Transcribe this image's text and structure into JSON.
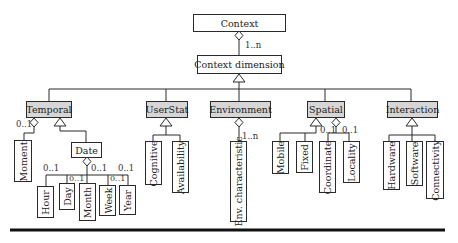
{
  "diagram": {
    "root": {
      "label": "Context"
    },
    "dimension": {
      "label": "Context dimension",
      "multiplicity": "1..n"
    },
    "categories": [
      {
        "label": "Temporal",
        "children": [
          {
            "label": "Moment",
            "multiplicity": "0..1",
            "relation": "aggregation"
          },
          {
            "label": "Date",
            "relation": "generalization",
            "children": [
              {
                "label": "Hour",
                "multiplicity": "0..1"
              },
              {
                "label": "Day",
                "multiplicity": "0..1"
              },
              {
                "label": "Month",
                "multiplicity": "0..1"
              },
              {
                "label": "Week",
                "multiplicity": "0..1"
              },
              {
                "label": "Year",
                "multiplicity": "0..1"
              }
            ]
          }
        ]
      },
      {
        "label": "UserStat",
        "children": [
          {
            "label": "Cognitive",
            "relation": "generalization"
          },
          {
            "label": "Availability",
            "relation": "generalization"
          }
        ]
      },
      {
        "label": "Environment",
        "children": [
          {
            "label": "Env. characteristic",
            "multiplicity": "1..n",
            "relation": "aggregation"
          }
        ]
      },
      {
        "label": "Spatial",
        "children": [
          {
            "label": "Mobile",
            "relation": "generalization"
          },
          {
            "label": "Fixed",
            "relation": "generalization"
          },
          {
            "label": "Coordinate",
            "multiplicity": "0..1",
            "relation": "aggregation"
          },
          {
            "label": "Locality",
            "multiplicity": "0..1",
            "relation": "aggregation"
          }
        ]
      },
      {
        "label": "Interaction",
        "children": [
          {
            "label": "Hardware",
            "relation": "generalization"
          },
          {
            "label": "Software",
            "relation": "generalization"
          },
          {
            "label": "Connectivity",
            "relation": "generalization"
          }
        ]
      }
    ],
    "labels": {
      "ctx_mult": "1..n",
      "moment_mult": "0..1",
      "hour_mult": "0..1",
      "day_mult": "0..1",
      "month_mult": "0..1",
      "week_mult": "0..1",
      "year_mult": "0..1",
      "env_mult": "1..n",
      "coord_mult": "0..1",
      "locality_mult": "0..1"
    },
    "colors": {
      "category_fill": "#d6d6d6",
      "line": "#2a2a2a"
    }
  }
}
